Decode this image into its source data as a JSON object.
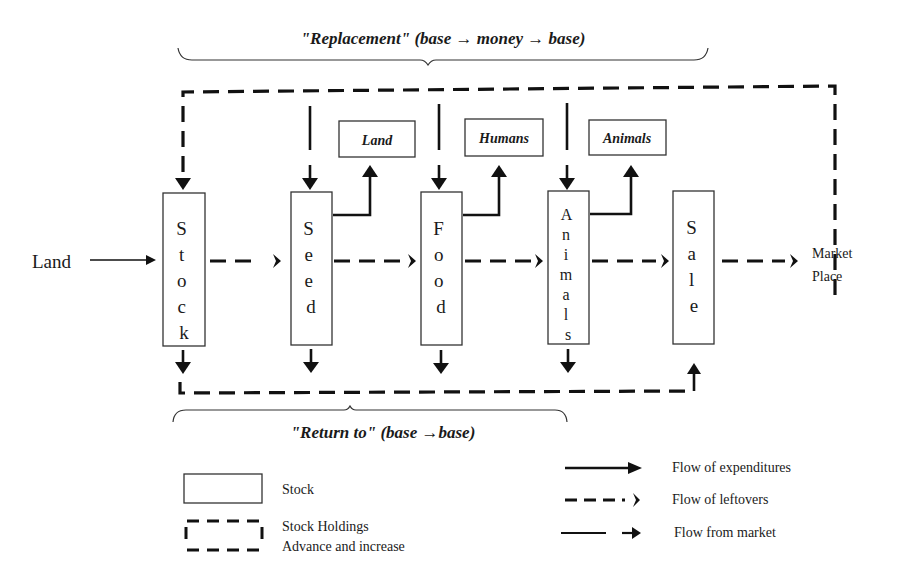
{
  "diagram": {
    "top_brace_label": "\"Replacement\"  (base → money → base)",
    "bottom_brace_label": "\"Return to\"  (base →base)",
    "input_label": "Land",
    "stocks": [
      {
        "id": "stock",
        "letters": [
          "S",
          "t",
          "o",
          "c",
          "k"
        ]
      },
      {
        "id": "seed",
        "letters": [
          "S",
          "e",
          "e",
          "d"
        ]
      },
      {
        "id": "food",
        "letters": [
          "F",
          "o",
          "o",
          "d"
        ]
      },
      {
        "id": "animals",
        "letters": [
          "A",
          "n",
          "i",
          "m",
          "a",
          "l",
          "s"
        ]
      },
      {
        "id": "sale",
        "letters": [
          "S",
          "a",
          "l",
          "e"
        ]
      }
    ],
    "outputs": [
      {
        "id": "land",
        "label": "Land"
      },
      {
        "id": "humans",
        "label": "Humans"
      },
      {
        "id": "animals",
        "label": "Animals"
      }
    ],
    "market": {
      "line1": "Market",
      "line2": "Place"
    }
  },
  "legend": {
    "stock": "Stock",
    "holdings_line1": "Stock Holdings",
    "holdings_line2": "Advance and increase",
    "expenditures": "Flow of expenditures",
    "leftovers": "Flow of leftovers",
    "from_market": "Flow from market"
  }
}
